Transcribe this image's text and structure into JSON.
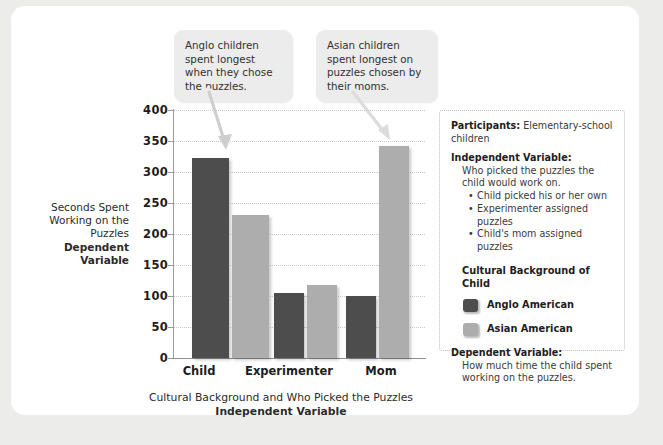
{
  "chart_data": {
    "type": "bar",
    "title": "",
    "categories": [
      "Child",
      "Experimenter",
      "Mom"
    ],
    "series": [
      {
        "name": "Anglo American",
        "color": "#4d4d4d",
        "values": [
          323,
          105,
          100
        ]
      },
      {
        "name": "Asian American",
        "color": "#adadad",
        "values": [
          230,
          118,
          342
        ]
      }
    ],
    "xlabel_line1": "Cultural Background and Who Picked the Puzzles",
    "xlabel_line2": "Independent Variable",
    "ylabel_lines": [
      "Seconds Spent",
      "Working on the",
      "Puzzles"
    ],
    "ylabel_bold_lines": [
      "Dependent",
      "Variable"
    ],
    "ylim": [
      0,
      400
    ],
    "yticks": [
      400,
      350,
      300,
      250,
      200,
      150,
      100,
      50,
      0
    ],
    "grid": true,
    "legend_position": "right-panel"
  },
  "callouts": [
    {
      "id": "anglo",
      "text": "Anglo children spent longest when they chose the puzzles."
    },
    {
      "id": "asian",
      "text": "Asian children spent longest on puzzles chosen by their moms."
    }
  ],
  "info_panel": {
    "participants_label": "Participants:",
    "participants_value": "Elementary-school children",
    "iv_label": "Independent Variable:",
    "iv_text": "Who picked the puzzles the child would work on.",
    "iv_bullets": [
      "Child picked his or her own",
      "Experimenter assigned puzzles",
      "Child's mom assigned puzzles"
    ],
    "legend_heading": "Cultural Background of Child",
    "legend_items": [
      {
        "label": "Anglo American",
        "color": "#4d4d4d"
      },
      {
        "label": "Asian American",
        "color": "#adadad"
      }
    ],
    "dv_label": "Dependent Variable:",
    "dv_text": "How much time the child spent working on the puzzles."
  },
  "colors": {
    "page_background": "#ececeb",
    "card_background": "#ffffff",
    "anglo_bar": "#4d4d4d",
    "asian_bar": "#adadad",
    "callout_background": "#ececec",
    "gridline": "#c9c9c9",
    "axis": "#9a9a9a"
  }
}
